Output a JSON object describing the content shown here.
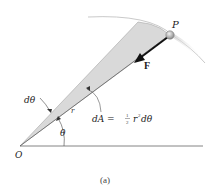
{
  "figure": {
    "caption": "(a)",
    "labels": {
      "point": "P",
      "force": "F",
      "origin": "O",
      "dtheta": "dθ",
      "radius": "r",
      "theta": "θ",
      "area_lhs": "dA = ",
      "area_frac_num": "1",
      "area_frac_den": "2",
      "area_rhs": "r",
      "area_exp": "2",
      "area_tail": "dθ"
    },
    "colors": {
      "wedge_fill": "#d9d9d9",
      "line": "#555555",
      "arc": "#bbbbbb",
      "arrow": "#111111",
      "particle": "#999999"
    }
  }
}
